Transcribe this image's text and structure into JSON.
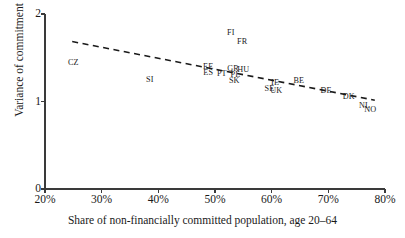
{
  "chart_data": {
    "type": "scatter",
    "title": "",
    "xlabel": "Share of non-financially committed population, age 20–64",
    "ylabel": "Variance of commitment",
    "xlim": [
      20,
      80
    ],
    "ylim": [
      0,
      2
    ],
    "xticks": [
      "20%",
      "30%",
      "40%",
      "50%",
      "60%",
      "70%",
      "80%"
    ],
    "xtick_values": [
      20,
      30,
      40,
      50,
      60,
      70,
      80
    ],
    "yticks": [
      "0",
      "1",
      "2"
    ],
    "ytick_values": [
      0,
      1,
      2
    ],
    "grid": false,
    "legend": "none",
    "point_marker": "text-label-only",
    "points": [
      {
        "label": "CZ",
        "x": 25.0,
        "y": 1.44
      },
      {
        "label": "SI",
        "x": 38.5,
        "y": 1.25
      },
      {
        "label": "EE",
        "x": 48.8,
        "y": 1.4
      },
      {
        "label": "ES",
        "x": 48.8,
        "y": 1.325
      },
      {
        "label": "PT",
        "x": 51.2,
        "y": 1.315
      },
      {
        "label": "GR",
        "x": 53.2,
        "y": 1.375
      },
      {
        "label": "HU",
        "x": 55.0,
        "y": 1.355
      },
      {
        "label": "PL",
        "x": 53.6,
        "y": 1.305
      },
      {
        "label": "SK",
        "x": 53.4,
        "y": 1.23
      },
      {
        "label": "FI",
        "x": 52.8,
        "y": 1.785
      },
      {
        "label": "FR",
        "x": 54.8,
        "y": 1.685
      },
      {
        "label": "SE",
        "x": 59.6,
        "y": 1.145
      },
      {
        "label": "IE",
        "x": 60.6,
        "y": 1.21
      },
      {
        "label": "UK",
        "x": 60.8,
        "y": 1.115
      },
      {
        "label": "BE",
        "x": 64.8,
        "y": 1.235
      },
      {
        "label": "DE",
        "x": 69.6,
        "y": 1.115
      },
      {
        "label": "DK",
        "x": 73.6,
        "y": 1.055
      },
      {
        "label": "NL",
        "x": 76.4,
        "y": 0.945
      },
      {
        "label": "NO",
        "x": 77.4,
        "y": 0.905
      }
    ],
    "trendline": {
      "style": "dashed",
      "x_start": 24.8,
      "y_start": 1.685,
      "x_end": 78.2,
      "y_end": 1.015
    }
  }
}
